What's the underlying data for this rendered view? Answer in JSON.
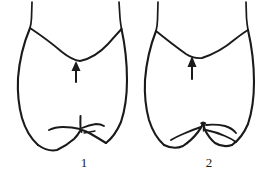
{
  "plate": {
    "name": "comparative-line-drawing-plate",
    "background_color": "#ffffff",
    "ink_color": "#1a1a1a",
    "description": "Two black-and-white line drawings of an abdominal terminal segment viewed ventrally, each marked with an upward arrow and numbered below.",
    "figures": [
      {
        "id": "figure-1",
        "caption": "1",
        "arrow": {
          "name": "pointer-arrow",
          "direction": "up",
          "tip_x": 76,
          "tip_y": 62,
          "tail_y": 82
        },
        "caption_x": 84,
        "caption_y": 166
      },
      {
        "id": "figure-2",
        "caption": "2",
        "arrow": {
          "name": "pointer-arrow",
          "direction": "up",
          "tip_x": 192,
          "tip_y": 57,
          "tail_y": 79
        },
        "caption_x": 209,
        "caption_y": 166
      }
    ]
  },
  "labels": {
    "figure_one": "1",
    "figure_two": "2"
  }
}
